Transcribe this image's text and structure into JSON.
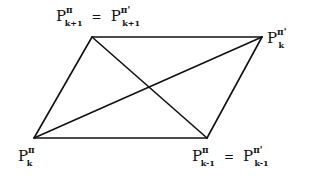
{
  "diagram": {
    "type": "parallelogram-with-diagonals",
    "stroke_color": "#111111",
    "background_color": "#ffffff",
    "vertices": {
      "top_left": {
        "x": 92,
        "y": 37
      },
      "top_right": {
        "x": 262,
        "y": 37
      },
      "bottom_right": {
        "x": 207,
        "y": 138
      },
      "bottom_left": {
        "x": 34,
        "y": 138
      }
    },
    "labels": {
      "top_left": {
        "left": {
          "base": "P",
          "sup": "π",
          "sub": "k+1"
        },
        "equals": "=",
        "right": {
          "base": "P",
          "sup": "π'",
          "sub": "k+1"
        }
      },
      "top_right": {
        "base": "P",
        "sup": "π'",
        "sub": "k"
      },
      "bottom_left": {
        "base": "P",
        "sup": "π",
        "sub": "k"
      },
      "bottom_right": {
        "left": {
          "base": "P",
          "sup": "π",
          "sub": "k-1"
        },
        "equals": "=",
        "right": {
          "base": "P",
          "sup": "π'",
          "sub": "k-1"
        }
      }
    }
  }
}
